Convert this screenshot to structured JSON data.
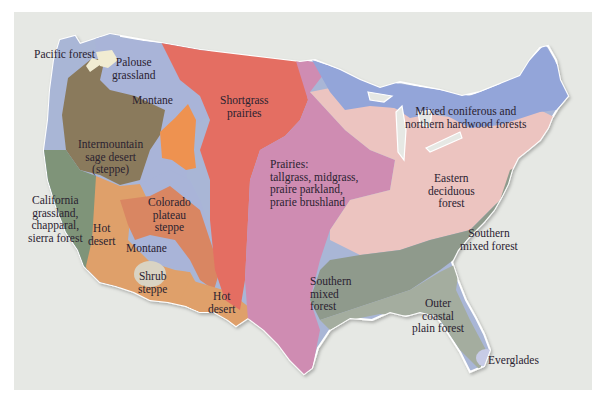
{
  "map": {
    "title": "Vegetation regions of the contiguous United States",
    "colors": {
      "background": "#e6e8e4",
      "pacific_forest": "#a9b6d6",
      "palouse": "#f1ecd2",
      "montane": "#a9b4d8",
      "intermountain": "#8a7a5c",
      "california": "#7f9479",
      "hot_desert": "#dfa06a",
      "colorado_plateau": "#d98662",
      "orange_patch": "#ee9250",
      "shortgrass": "#e46e62",
      "prairies": "#cf8cb2",
      "mixed_coniferous": "#93a5d9",
      "eastern_deciduous": "#ecc4c0",
      "southern_mixed": "#8f9a8c",
      "outer_coastal": "#a4ad9f",
      "everglades": "#c7cbe6",
      "shrub_steppe": "#d9d3c3"
    },
    "regions": [
      {
        "id": "pacific-forest",
        "label": "Pacific forest"
      },
      {
        "id": "palouse-grassland",
        "label": "Palouse\ngrassland"
      },
      {
        "id": "montane-north",
        "label": "Montane"
      },
      {
        "id": "intermountain",
        "label": "Intermountain\nsage desert\n(steppe)"
      },
      {
        "id": "california",
        "label": "California\ngrassland,\nchapparal,\nsierra forest"
      },
      {
        "id": "hot-desert-west",
        "label": "Hot\ndesert"
      },
      {
        "id": "colorado-plateau",
        "label": "Colorado\nplateau\nsteppe"
      },
      {
        "id": "montane-south",
        "label": "Montane"
      },
      {
        "id": "shrub-steppe",
        "label": "Shrub\nsteppe"
      },
      {
        "id": "hot-desert-texas",
        "label": "Hot\ndesert"
      },
      {
        "id": "shortgrass",
        "label": "Shortgrass\nprairies"
      },
      {
        "id": "prairies",
        "label": "Prairies:\ntallgrass, midgrass,\npraire parkland,\nprarie brushland"
      },
      {
        "id": "mixed-coniferous",
        "label": "Mixed coniferous and\nnorthern hardwood forests"
      },
      {
        "id": "eastern-deciduous",
        "label": "Eastern\ndeciduous\nforest"
      },
      {
        "id": "southern-mixed-east",
        "label": "Southern\nmixed forest"
      },
      {
        "id": "southern-mixed-west",
        "label": "Southern\nmixed\nforest"
      },
      {
        "id": "outer-coastal",
        "label": "Outer\ncoastal\nplain forest"
      },
      {
        "id": "everglades",
        "label": "Everglades"
      }
    ]
  }
}
